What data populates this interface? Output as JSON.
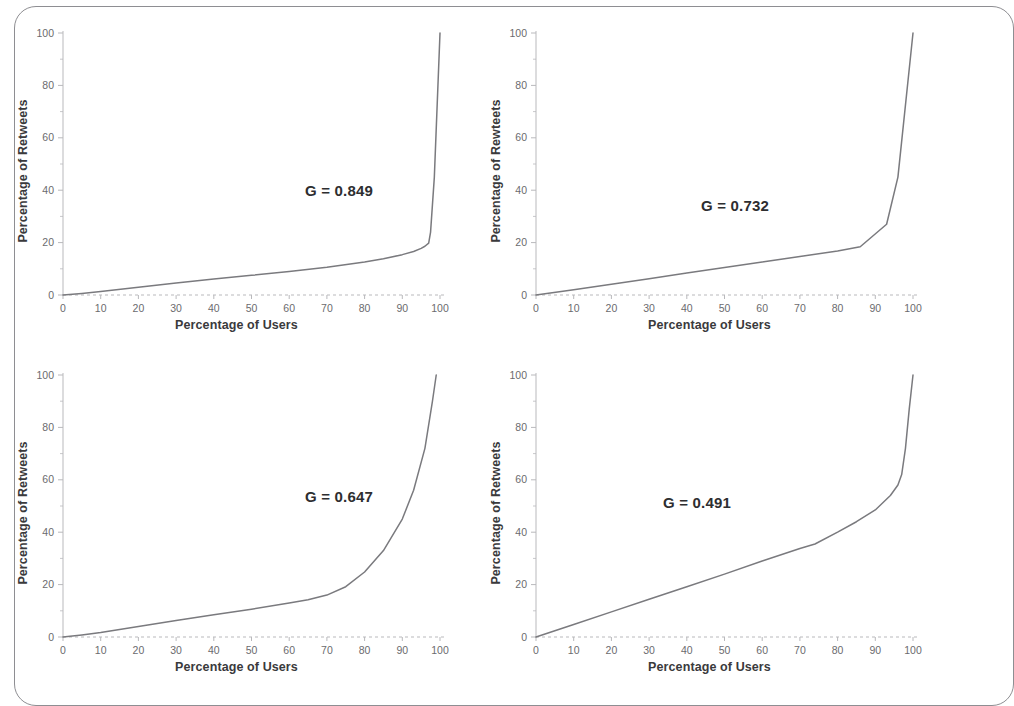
{
  "figure": {
    "background": "#ffffff",
    "frame_color": "#8e8e92",
    "curve_color": "#7a7a7e",
    "axis_color": "#b9b9bc",
    "tick_label_color": "#6b6b6e",
    "axis_title_color": "#3a3a3c"
  },
  "axis": {
    "x_ticks": [
      "0",
      "10",
      "20",
      "30",
      "40",
      "50",
      "60",
      "70",
      "80",
      "90",
      "100"
    ],
    "y_ticks": [
      "0",
      "20",
      "40",
      "60",
      "80",
      "100"
    ],
    "x_title": "Percentage of Users",
    "y_title": "Percentage of Retweets",
    "y_title_typo": "Percentage of Rewteets"
  },
  "panels": [
    {
      "id": "panel-top-left",
      "gini_label": "G = 0.849",
      "xlabel": "Percentage of Users",
      "ylabel": "Percentage of Retweets"
    },
    {
      "id": "panel-top-right",
      "gini_label": "G = 0.732",
      "xlabel": "Percentage of Users",
      "ylabel": "Percentage of Rewteets"
    },
    {
      "id": "panel-bottom-left",
      "gini_label": "G = 0.647",
      "xlabel": "Percentage of Users",
      "ylabel": "Percentage of Retweets"
    },
    {
      "id": "panel-bottom-right",
      "gini_label": "G = 0.491",
      "xlabel": "Percentage of Users",
      "ylabel": "Percentage of Retweets"
    }
  ],
  "chart_data": [
    {
      "type": "line",
      "id": "lorenz-curve-g-0849",
      "title": "",
      "subtitle": "",
      "xlabel": "Percentage of Users",
      "ylabel": "Percentage of Retweets",
      "xlim": [
        0,
        100
      ],
      "ylim": [
        0,
        100
      ],
      "grid": false,
      "legend": "none",
      "annotations": [
        "G = 0.849"
      ],
      "gini": 0.849,
      "x": [
        0,
        5,
        10,
        20,
        30,
        40,
        50,
        60,
        70,
        80,
        85,
        90,
        93,
        95,
        96,
        97,
        97.5,
        98.5,
        100
      ],
      "y": [
        0,
        0.6,
        1.3,
        3.0,
        4.6,
        6.1,
        7.5,
        9.0,
        10.6,
        12.6,
        13.8,
        15.4,
        16.6,
        17.8,
        18.6,
        19.8,
        24,
        45,
        100
      ]
    },
    {
      "type": "line",
      "id": "lorenz-curve-g-0732",
      "title": "",
      "subtitle": "",
      "xlabel": "Percentage of Users",
      "ylabel": "Percentage of Rewteets",
      "xlim": [
        0,
        100
      ],
      "ylim": [
        0,
        100
      ],
      "grid": false,
      "legend": "none",
      "annotations": [
        "G = 0.732"
      ],
      "gini": 0.732,
      "x": [
        0,
        10,
        20,
        30,
        40,
        50,
        60,
        70,
        80,
        86,
        93,
        96,
        100
      ],
      "y": [
        0,
        2.0,
        4.1,
        6.2,
        8.4,
        10.5,
        12.6,
        14.7,
        16.8,
        18.4,
        27.0,
        45.0,
        100
      ]
    },
    {
      "type": "line",
      "id": "lorenz-curve-g-0647",
      "title": "",
      "subtitle": "",
      "xlabel": "Percentage of Users",
      "ylabel": "Percentage of Retweets",
      "xlim": [
        0,
        100
      ],
      "ylim": [
        0,
        100
      ],
      "grid": false,
      "legend": "none",
      "annotations": [
        "G = 0.647"
      ],
      "gini": 0.647,
      "x": [
        0,
        5,
        10,
        20,
        30,
        40,
        50,
        60,
        65,
        70,
        75,
        80,
        85,
        90,
        93,
        96,
        98,
        99
      ],
      "y": [
        0,
        0.8,
        1.7,
        4.0,
        6.3,
        8.5,
        10.6,
        13.0,
        14.2,
        16.0,
        19.2,
        24.8,
        33.0,
        45.0,
        56.0,
        72.0,
        90.0,
        100
      ]
    },
    {
      "type": "line",
      "id": "lorenz-curve-g-0491",
      "title": "",
      "subtitle": "",
      "xlabel": "Percentage of Users",
      "ylabel": "Percentage of Retweets",
      "xlim": [
        0,
        100
      ],
      "ylim": [
        0,
        100
      ],
      "grid": false,
      "legend": "none",
      "annotations": [
        "G = 0.491"
      ],
      "gini": 0.491,
      "x": [
        0,
        10,
        20,
        30,
        40,
        50,
        60,
        70,
        74,
        80,
        85,
        90,
        94,
        96,
        97,
        98,
        99,
        100
      ],
      "y": [
        0,
        4.8,
        9.6,
        14.4,
        19.2,
        24.0,
        29.0,
        33.8,
        35.5,
        40.0,
        44.0,
        48.5,
        54.0,
        58.0,
        62.0,
        72.0,
        87.0,
        100
      ]
    }
  ]
}
